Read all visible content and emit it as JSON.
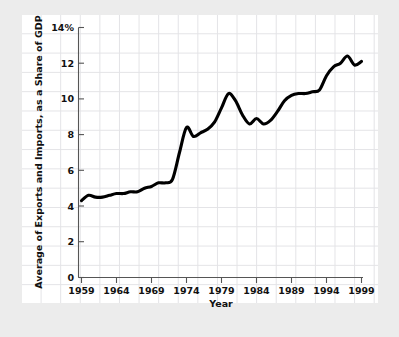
{
  "chart_data": {
    "type": "line",
    "title": "",
    "xlabel": "Year",
    "ylabel": "Average of Exports and Imports, as a Share of GDP",
    "xlim": [
      1959,
      2000
    ],
    "ylim": [
      0,
      14
    ],
    "grid": true,
    "legend": null,
    "x_tick_labels": [
      "1959",
      "1964",
      "1969",
      "1974",
      "1979",
      "1984",
      "1989",
      "1994",
      "1999"
    ],
    "x_ticks": [
      1959,
      1964,
      1969,
      1974,
      1979,
      1984,
      1989,
      1994,
      1999
    ],
    "y_tick_labels": [
      "0",
      "2",
      "4",
      "6",
      "8",
      "10",
      "12",
      "14%"
    ],
    "y_ticks": [
      0,
      2,
      4,
      6,
      8,
      10,
      12,
      14
    ],
    "series": [
      {
        "name": "Average of Exports and Imports, as a Share of GDP",
        "color": "#000000",
        "x": [
          1959,
          1960,
          1961,
          1962,
          1963,
          1964,
          1965,
          1966,
          1967,
          1968,
          1969,
          1970,
          1971,
          1972,
          1973,
          1974,
          1975,
          1976,
          1977,
          1978,
          1979,
          1980,
          1981,
          1982,
          1983,
          1984,
          1985,
          1986,
          1987,
          1988,
          1989,
          1990,
          1991,
          1992,
          1993,
          1994,
          1995,
          1996,
          1997,
          1998,
          1999
        ],
        "values": [
          4.3,
          4.6,
          4.5,
          4.5,
          4.6,
          4.7,
          4.7,
          4.8,
          4.8,
          5.0,
          5.1,
          5.3,
          5.3,
          5.5,
          7.0,
          8.4,
          7.9,
          8.1,
          8.3,
          8.7,
          9.5,
          10.3,
          9.9,
          9.1,
          8.6,
          8.9,
          8.6,
          8.8,
          9.3,
          9.9,
          10.2,
          10.3,
          10.3,
          10.4,
          10.5,
          11.3,
          11.8,
          12.0,
          12.4,
          11.9,
          12.1
        ]
      }
    ]
  },
  "axes": {
    "y_axis_title": "Average of Exports and Imports, as a Share of GDP",
    "x_axis_title": "Year",
    "y_labels": [
      "14%",
      "12",
      "10",
      "8",
      "6",
      "4",
      "2",
      "0"
    ],
    "x_labels": [
      "1959",
      "1964",
      "1969",
      "1974",
      "1979",
      "1984",
      "1989",
      "1994",
      "1999"
    ]
  },
  "colors": {
    "line": "#000000",
    "axis": "#555555",
    "grid": "#e3e3e6",
    "card_background": "#ffffff",
    "page_background": "#ececec",
    "text": "#111111"
  }
}
